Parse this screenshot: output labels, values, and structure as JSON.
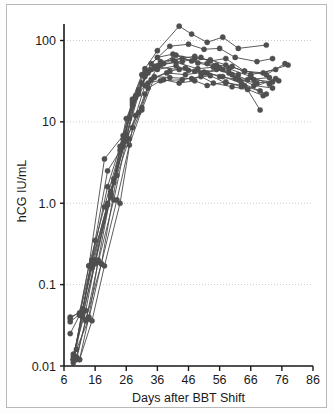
{
  "figure": {
    "background_color": "#ffffff",
    "frame_color": "#b9b9b9",
    "series_color": "#4a4a4a",
    "marker_color": "#4f4f4f",
    "gridline_color": "#bdbdbd",
    "axis_color": "#1a1a1a"
  },
  "chart_data": {
    "type": "line",
    "title": "",
    "xlabel": "Days after BBT Shift",
    "ylabel": "hCG IU/mL",
    "xlim": [
      6,
      86
    ],
    "ylim": [
      0.01,
      200
    ],
    "yscale": "log",
    "xscale": "linear",
    "grid": true,
    "grid_axis": "y",
    "legend": "none",
    "xticks": [
      6,
      16,
      26,
      36,
      46,
      56,
      66,
      76,
      86
    ],
    "xticklabels": [
      "6",
      "16",
      "26",
      "36",
      "46",
      "56",
      "66",
      "76",
      "86"
    ],
    "yticks": [
      0.01,
      0.1,
      1.0,
      10,
      100
    ],
    "yticklabels": [
      "0.01",
      "0.1",
      "1.0",
      "10",
      "100"
    ],
    "marker": "filled-circle",
    "marker_size": 5,
    "series": [
      {
        "name": "subject-1",
        "x": [
          9,
          12,
          15,
          20,
          25,
          28,
          32,
          36,
          43,
          47,
          52,
          57,
          62,
          71
        ],
        "y": [
          0.012,
          0.05,
          0.18,
          1.0,
          5.0,
          18,
          45,
          75,
          150,
          120,
          95,
          110,
          80,
          88
        ]
      },
      {
        "name": "subject-2",
        "x": [
          9,
          12,
          16,
          21,
          26,
          30,
          34,
          40,
          46,
          51,
          56,
          61,
          68,
          73
        ],
        "y": [
          0.011,
          0.04,
          0.2,
          1.2,
          6.5,
          22,
          52,
          85,
          90,
          78,
          80,
          62,
          55,
          60
        ]
      },
      {
        "name": "subject-3",
        "x": [
          8,
          11,
          14,
          19,
          24,
          27,
          31,
          35,
          41,
          48,
          53,
          58,
          64,
          70,
          78
        ],
        "y": [
          0.04,
          0.045,
          0.17,
          0.9,
          4.5,
          11,
          30,
          48,
          58,
          64,
          56,
          60,
          42,
          40,
          50
        ]
      },
      {
        "name": "subject-4",
        "x": [
          10,
          13,
          17,
          22,
          26,
          29,
          33,
          38,
          44,
          50,
          55,
          60,
          66,
          74
        ],
        "y": [
          0.013,
          0.036,
          0.19,
          1.1,
          6.0,
          20,
          42,
          52,
          55,
          62,
          50,
          48,
          38,
          44
        ]
      },
      {
        "name": "subject-5",
        "x": [
          9,
          12,
          15,
          20,
          25,
          28,
          32,
          37,
          42,
          49,
          54,
          59,
          65,
          72
        ],
        "y": [
          0.012,
          0.05,
          0.16,
          0.95,
          5.5,
          16,
          36,
          50,
          54,
          45,
          47,
          40,
          33,
          35
        ]
      },
      {
        "name": "subject-6",
        "x": [
          8,
          11,
          15,
          21,
          26,
          30,
          33,
          36,
          43,
          48,
          52,
          57,
          63,
          69
        ],
        "y": [
          0.025,
          0.042,
          0.2,
          1.3,
          7.0,
          24,
          40,
          47,
          44,
          42,
          40,
          36,
          30,
          24
        ]
      },
      {
        "name": "subject-7",
        "x": [
          10,
          14,
          18,
          23,
          27,
          31,
          34,
          39,
          45,
          51,
          56,
          62,
          68,
          75
        ],
        "y": [
          0.016,
          0.038,
          0.18,
          2.2,
          6.2,
          15,
          33,
          40,
          38,
          41,
          36,
          33,
          30,
          32
        ]
      },
      {
        "name": "subject-8",
        "x": [
          9,
          12,
          16,
          20,
          26,
          29,
          32,
          35,
          40,
          47,
          53,
          58,
          64,
          71
        ],
        "y": [
          0.012,
          0.046,
          0.35,
          2.5,
          5.8,
          12,
          28,
          36,
          35,
          34,
          37,
          30,
          28,
          22
        ]
      },
      {
        "name": "subject-9",
        "x": [
          8,
          11,
          14,
          19,
          25,
          28,
          31,
          36,
          42,
          46,
          51,
          57,
          61,
          67,
          73
        ],
        "y": [
          0.035,
          0.043,
          0.17,
          3.5,
          6.8,
          19,
          38,
          44,
          49,
          43,
          40,
          44,
          34,
          33,
          31
        ]
      },
      {
        "name": "subject-10",
        "x": [
          11,
          14,
          17,
          22,
          26,
          30,
          34,
          37,
          44,
          49,
          54,
          59,
          66,
          72
        ],
        "y": [
          0.012,
          0.04,
          0.2,
          2.0,
          11,
          25,
          44,
          55,
          60,
          53,
          48,
          45,
          36,
          29
        ]
      },
      {
        "name": "subject-11",
        "x": [
          9,
          13,
          16,
          21,
          25,
          29,
          33,
          38,
          43,
          48,
          52,
          58,
          63,
          70
        ],
        "y": [
          0.014,
          0.048,
          0.19,
          1.4,
          6.1,
          21,
          30,
          33,
          30,
          32,
          28,
          31,
          27,
          21
        ]
      },
      {
        "name": "subject-12",
        "x": [
          10,
          13,
          18,
          23,
          27,
          31,
          35,
          40,
          45,
          50,
          55,
          60,
          67,
          73
        ],
        "y": [
          0.012,
          0.037,
          0.18,
          1.1,
          5.2,
          14,
          35,
          42,
          46,
          40,
          44,
          38,
          28,
          26
        ]
      },
      {
        "name": "subject-13",
        "x": [
          8,
          12,
          15,
          20,
          24,
          28,
          32,
          36,
          41,
          47,
          52,
          56,
          62,
          69
        ],
        "y": [
          0.038,
          0.05,
          0.2,
          1.6,
          5.0,
          17,
          41,
          62,
          68,
          56,
          52,
          46,
          38,
          14
        ]
      },
      {
        "name": "subject-14",
        "x": [
          11,
          15,
          19,
          24,
          28,
          32,
          36,
          42,
          48,
          53,
          58,
          64,
          71,
          77
        ],
        "y": [
          0.012,
          0.036,
          0.17,
          1.0,
          8.5,
          22,
          49,
          66,
          60,
          58,
          50,
          42,
          38,
          52
        ]
      },
      {
        "name": "subject-15",
        "x": [
          9,
          12,
          16,
          22,
          26,
          30,
          33,
          37,
          44,
          50,
          54,
          60,
          65,
          74
        ],
        "y": [
          0.013,
          0.044,
          0.18,
          1.8,
          6.4,
          13,
          26,
          32,
          33,
          36,
          30,
          27,
          25,
          34
        ]
      }
    ]
  }
}
